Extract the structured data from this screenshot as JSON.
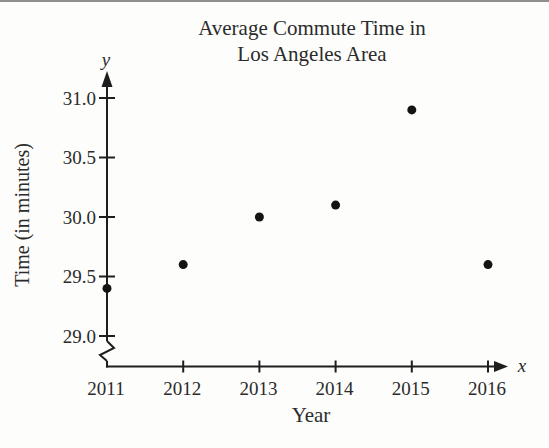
{
  "chart_data": {
    "type": "scatter",
    "title_lines": [
      "Average Commute Time in",
      "Los Angeles Area"
    ],
    "xlabel": "Year",
    "ylabel": "Time (in minutes)",
    "x_axis_letter": "x",
    "y_axis_letter": "y",
    "x": [
      2011,
      2012,
      2013,
      2014,
      2015,
      2016
    ],
    "values": [
      29.4,
      29.6,
      30.0,
      30.1,
      30.9,
      29.6
    ],
    "x_tick_labels": [
      "2011",
      "2012",
      "2013",
      "2014",
      "2015",
      "2016"
    ],
    "y_ticks": [
      29.0,
      29.5,
      30.0,
      30.5,
      31.0
    ],
    "y_tick_labels": [
      "29.0",
      "29.5",
      "30.0",
      "30.5",
      "31.0"
    ],
    "xlim": [
      2011,
      2016
    ],
    "ylim": [
      29.0,
      31.0
    ],
    "axis_break_on_y": true,
    "grid": false,
    "legend": null,
    "point_color": "#141414",
    "axis_color": "#1e1e1e"
  }
}
